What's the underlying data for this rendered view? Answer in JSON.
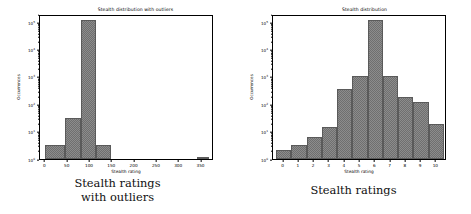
{
  "panels": [
    {
      "key": "outliers",
      "title": "Stealth distribution with outliers",
      "xlabel": "Stealth rating",
      "ylabel": "Occurrences",
      "caption_line1": "Stealth ratings",
      "caption_line2": "with outliers"
    },
    {
      "key": "clean",
      "title": "Stealth distribution",
      "xlabel": "Stealth rating",
      "ylabel": "Occurrences",
      "caption_line1": "Stealth ratings",
      "caption_line2": ""
    }
  ],
  "yticks": [
    {
      "label": "10",
      "exp": "0",
      "value": 1
    },
    {
      "label": "10",
      "exp": "1",
      "value": 10
    },
    {
      "label": "10",
      "exp": "2",
      "value": 100
    },
    {
      "label": "10",
      "exp": "3",
      "value": 1000
    },
    {
      "label": "10",
      "exp": "4",
      "value": 10000
    },
    {
      "label": "10",
      "exp": "5",
      "value": 100000
    }
  ],
  "colors": {
    "bar_fill": "#6f6f6f",
    "bar_edge": "#5a5a5a",
    "axis": "#000000",
    "background": "#ffffff",
    "caption_text": "#101010"
  },
  "chart_data": [
    {
      "type": "bar",
      "title": "Stealth distribution with outliers",
      "xlabel": "Stealth rating",
      "ylabel": "Occurrences",
      "yscale": "log",
      "ylim": [
        1,
        200000
      ],
      "xlim": [
        -12,
        378
      ],
      "grid": false,
      "legend": null,
      "xticks": [
        0,
        50,
        100,
        150,
        200,
        250,
        300,
        350
      ],
      "ytick_labels": [
        "10^0",
        "10^1",
        "10^2",
        "10^3",
        "10^4",
        "10^5"
      ],
      "bins": [
        {
          "x0": 0,
          "x1": 45,
          "value": 3
        },
        {
          "x0": 45,
          "x1": 80,
          "value": 30
        },
        {
          "x0": 80,
          "x1": 113,
          "value": 120000
        },
        {
          "x0": 113,
          "x1": 148,
          "value": 3
        },
        {
          "x0": 340,
          "x1": 366,
          "value": 1
        }
      ]
    },
    {
      "type": "bar",
      "title": "Stealth distribution",
      "xlabel": "Stealth rating",
      "ylabel": "Occurrences",
      "yscale": "log",
      "ylim": [
        1,
        200000
      ],
      "xlim": [
        -0.7,
        10.7
      ],
      "grid": false,
      "legend": null,
      "xticks": [
        0,
        1,
        2,
        3,
        4,
        5,
        6,
        7,
        8,
        9,
        10
      ],
      "ytick_labels": [
        "10^0",
        "10^1",
        "10^2",
        "10^3",
        "10^4",
        "10^5"
      ],
      "bins": [
        {
          "x0": -0.5,
          "x1": 0.5,
          "value": 2
        },
        {
          "x0": 0.5,
          "x1": 1.5,
          "value": 3
        },
        {
          "x0": 1.5,
          "x1": 2.5,
          "value": 6
        },
        {
          "x0": 2.5,
          "x1": 3.5,
          "value": 14
        },
        {
          "x0": 3.5,
          "x1": 4.5,
          "value": 350
        },
        {
          "x0": 4.5,
          "x1": 5.5,
          "value": 1000
        },
        {
          "x0": 5.5,
          "x1": 6.5,
          "value": 120000
        },
        {
          "x0": 6.5,
          "x1": 7.5,
          "value": 1000
        },
        {
          "x0": 7.5,
          "x1": 8.5,
          "value": 180
        },
        {
          "x0": 8.5,
          "x1": 9.5,
          "value": 120
        },
        {
          "x0": 9.5,
          "x1": 10.5,
          "value": 18
        }
      ]
    }
  ]
}
